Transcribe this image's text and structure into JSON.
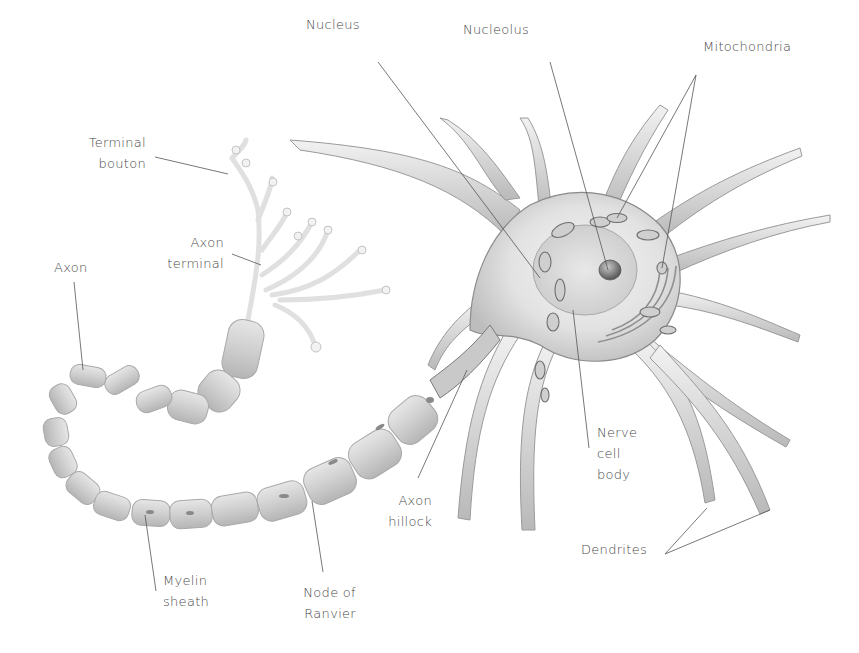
{
  "diagram": {
    "colors": {
      "background": "#ffffff",
      "label_text": "#4a4a4a",
      "leader_line": "#555555",
      "cell_body_fill": "#e6e6e6",
      "cell_body_stroke": "#8a8a8a",
      "myelin_fill": "#d2d2d2",
      "myelin_stroke": "#a9a9a9",
      "terminal_fill": "#f0f0f0",
      "organelle_fill": "#bdbdbd"
    },
    "labels": [
      {
        "id": "nucleus",
        "text": "Nucleus",
        "x": 306,
        "y": 40,
        "align": "left",
        "line": [
          [
            378,
            62
          ],
          [
            540,
            278
          ]
        ]
      },
      {
        "id": "nucleolus",
        "text": "Nucleolus",
        "x": 463,
        "y": 45,
        "align": "left",
        "line": [
          [
            550,
            62
          ],
          [
            608,
            270
          ]
        ]
      },
      {
        "id": "mitochondria",
        "text": "Mitochondria",
        "x": 703,
        "y": 62,
        "align": "left",
        "lines": [
          [
            [
              696,
              75
            ],
            [
              617,
              218
            ]
          ],
          [
            [
              696,
              75
            ],
            [
              662,
              268
            ]
          ]
        ]
      },
      {
        "id": "terminal-bouton",
        "text": "Terminal\nbouton",
        "x": 80,
        "y": 138,
        "align": "right",
        "right": 713,
        "line": [
          [
            155,
            157
          ],
          [
            228,
            174
          ]
        ]
      },
      {
        "id": "axon-terminal",
        "text": "Axon\nterminal",
        "x": 160,
        "y": 238,
        "align": "right",
        "right": 636,
        "line": [
          [
            232,
            254
          ],
          [
            261,
            265
          ]
        ]
      },
      {
        "id": "axon",
        "text": "Axon",
        "x": 54,
        "y": 260,
        "align": "left",
        "line": [
          [
            74,
            282
          ],
          [
            83,
            370
          ]
        ]
      },
      {
        "id": "axon-hillock",
        "text": "Axon\nhillock",
        "x": 402,
        "y": 488,
        "align": "left",
        "line": [
          [
            418,
            478
          ],
          [
            467,
            370
          ]
        ]
      },
      {
        "id": "nerve-cell-body",
        "text": "Nerve\ncell\nbody",
        "x": 597,
        "y": 426,
        "align": "left",
        "line": [
          [
            589,
            448
          ],
          [
            573,
            310
          ]
        ]
      },
      {
        "id": "myelin-sheath",
        "text": "Myelin\nsheath",
        "x": 163,
        "y": 568,
        "align": "left",
        "line": [
          [
            156,
            591
          ],
          [
            145,
            515
          ]
        ]
      },
      {
        "id": "node-of-ranvier",
        "text": "Node of\nRanvier",
        "x": 289,
        "y": 582,
        "align": "left",
        "line": [
          [
            323,
            572
          ],
          [
            312,
            501
          ]
        ]
      },
      {
        "id": "dendrites",
        "text": "Dendrites",
        "x": 581,
        "y": 538,
        "align": "left",
        "lines": [
          [
            [
              665,
              554
            ],
            [
              707,
              508
            ]
          ],
          [
            [
              665,
              554
            ],
            [
              770,
              510
            ]
          ]
        ]
      }
    ]
  }
}
